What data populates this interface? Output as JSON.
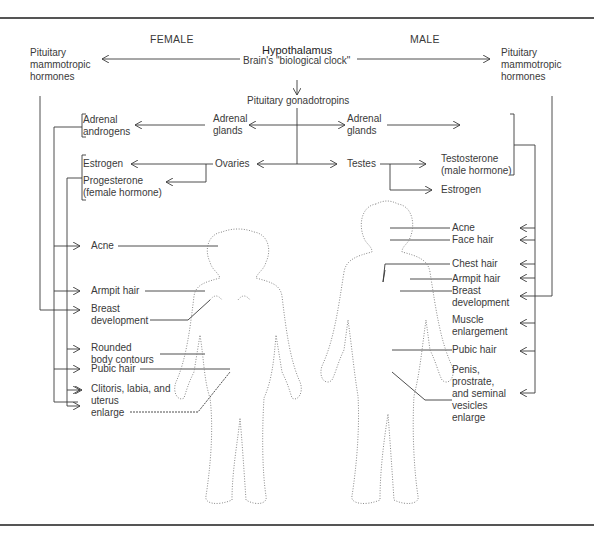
{
  "headers": {
    "female": "FEMALE",
    "male": "MALE"
  },
  "center": {
    "hypothalamus": "Hypothalamus",
    "clock": "Brain's \"biological clock\"",
    "gonadotropins": "Pituitary gonadotropins",
    "adrenal_left": "Adrenal",
    "adrenal_left2": "glands",
    "adrenal_right": "Adrenal",
    "adrenal_right2": "glands",
    "ovaries": "Ovaries",
    "testes": "Testes"
  },
  "female": {
    "pituitary1": "Pituitary",
    "pituitary2": "mammotropic",
    "pituitary3": "hormones",
    "adrenal_androgens1": "Adrenal",
    "adrenal_androgens2": "androgens",
    "estrogen": "Estrogen",
    "progesterone1": "Progesterone",
    "progesterone2": "(female hormone)",
    "effects": {
      "acne": "Acne",
      "armpit": "Armpit hair",
      "breast1": "Breast",
      "breast2": "development",
      "rounded1": "Rounded",
      "rounded2": "body contours",
      "pubic": "Pubic hair",
      "clitoris1": "Clitoris, labia, and",
      "clitoris2": "uterus",
      "clitoris3": "enlarge"
    }
  },
  "male": {
    "pituitary1": "Pituitary",
    "pituitary2": "mammotropic",
    "pituitary3": "hormones",
    "testosterone1": "Testosterone",
    "testosterone2": "(male hormone)",
    "estrogen": "Estrogen",
    "effects": {
      "acne": "Acne",
      "face": "Face hair",
      "chest": "Chest hair",
      "armpit": "Armpit hair",
      "breast1": "Breast",
      "breast2": "development",
      "muscle1": "Muscle",
      "muscle2": "enlargement",
      "pubic": "Pubic hair",
      "penis1": "Penis,",
      "penis2": "prostrate,",
      "penis3": "and seminal",
      "penis4": "vesicles",
      "penis5": "enlarge"
    }
  },
  "colors": {
    "line": "#3a3a3a",
    "dotted": "#888888",
    "rule": "#555555"
  }
}
